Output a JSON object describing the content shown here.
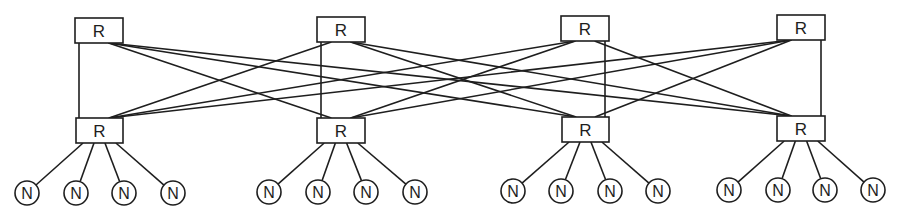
{
  "diagram": {
    "type": "two-tier router network (complete bipartite between router tiers)",
    "router_label": "R",
    "node_label": "N",
    "colors": {
      "stroke": "#1e1e1e",
      "background": "#ffffff"
    },
    "top_routers": [
      {
        "id": "T1",
        "label": "R",
        "x": 75,
        "y": 18,
        "w": 48,
        "h": 25
      },
      {
        "id": "T2",
        "label": "R",
        "x": 317,
        "y": 17,
        "w": 48,
        "h": 25
      },
      {
        "id": "T3",
        "label": "R",
        "x": 561,
        "y": 16,
        "w": 48,
        "h": 25
      },
      {
        "id": "T4",
        "label": "R",
        "x": 777,
        "y": 15,
        "w": 48,
        "h": 25
      }
    ],
    "bottom_routers": [
      {
        "id": "B1",
        "label": "R",
        "x": 76,
        "y": 118,
        "w": 47,
        "h": 25
      },
      {
        "id": "B2",
        "label": "R",
        "x": 317,
        "y": 118,
        "w": 48,
        "h": 25
      },
      {
        "id": "B3",
        "label": "R",
        "x": 562,
        "y": 117,
        "w": 47,
        "h": 25
      },
      {
        "id": "B4",
        "label": "R",
        "x": 777,
        "y": 116,
        "w": 48,
        "h": 25
      }
    ],
    "node_groups": [
      {
        "router": "B1",
        "nodes": [
          {
            "label": "N",
            "cx": 27,
            "cy": 193
          },
          {
            "label": "N",
            "cx": 76,
            "cy": 193
          },
          {
            "label": "N",
            "cx": 124,
            "cy": 193
          },
          {
            "label": "N",
            "cx": 173,
            "cy": 193
          }
        ]
      },
      {
        "router": "B2",
        "nodes": [
          {
            "label": "N",
            "cx": 269,
            "cy": 192
          },
          {
            "label": "N",
            "cx": 318,
            "cy": 192
          },
          {
            "label": "N",
            "cx": 366,
            "cy": 192
          },
          {
            "label": "N",
            "cx": 415,
            "cy": 192
          }
        ]
      },
      {
        "router": "B3",
        "nodes": [
          {
            "label": "N",
            "cx": 513,
            "cy": 191
          },
          {
            "label": "N",
            "cx": 561,
            "cy": 191
          },
          {
            "label": "N",
            "cx": 610,
            "cy": 191
          },
          {
            "label": "N",
            "cx": 658,
            "cy": 191
          }
        ]
      },
      {
        "router": "B4",
        "nodes": [
          {
            "label": "N",
            "cx": 729,
            "cy": 190
          },
          {
            "label": "N",
            "cx": 778,
            "cy": 190
          },
          {
            "label": "N",
            "cx": 825,
            "cy": 190
          },
          {
            "label": "N",
            "cx": 873,
            "cy": 190
          }
        ]
      }
    ],
    "node_radius": 12,
    "edges_between_tiers": "every top router connects to every bottom router (16 links)"
  }
}
